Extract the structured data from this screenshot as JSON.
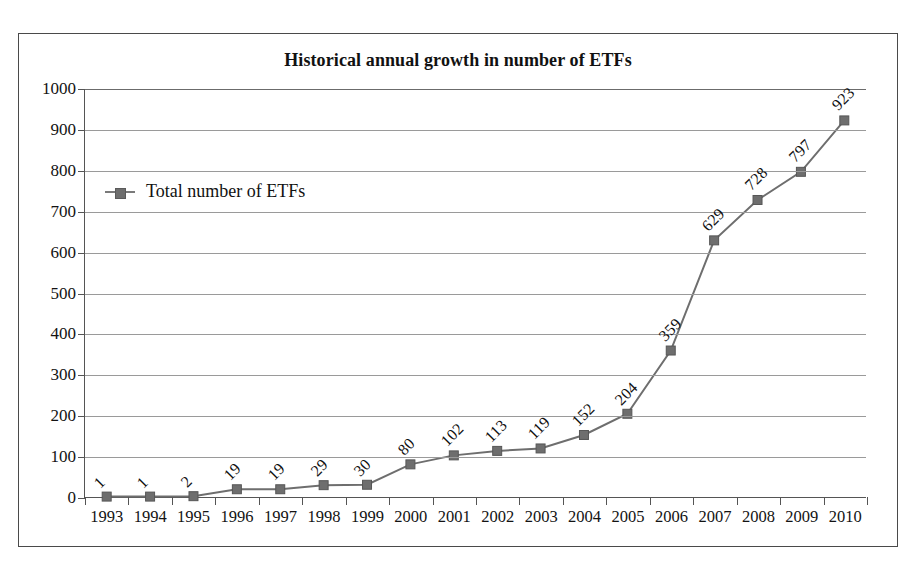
{
  "figure": {
    "title": "Historical annual growth in number of ETFs",
    "border_color": "#4a4a4a",
    "background": "#ffffff"
  },
  "legend": {
    "position": "inside-top-left",
    "marker": "square-marker-icon",
    "entries": [
      {
        "label": "Total number of ETFs",
        "color": "#6e6e6e"
      }
    ]
  },
  "axes": {
    "y": {
      "ticks": [
        "0",
        "100",
        "200",
        "300",
        "400",
        "500",
        "600",
        "700",
        "800",
        "900",
        "1000"
      ],
      "min": 0,
      "max": 1000,
      "step": 100
    },
    "x": {
      "ticks": [
        "1993",
        "1994",
        "1995",
        "1996",
        "1997",
        "1998",
        "1999",
        "2000",
        "2001",
        "2002",
        "2003",
        "2004",
        "2005",
        "2006",
        "2007",
        "2008",
        "2009",
        "2010"
      ]
    }
  },
  "chart_data": {
    "type": "line",
    "title": "Historical annual growth in number of ETFs",
    "xlabel": "",
    "ylabel": "",
    "ylim": [
      0,
      1000
    ],
    "grid": true,
    "legend_position": "inside-top-left",
    "categories": [
      "1993",
      "1994",
      "1995",
      "1996",
      "1997",
      "1998",
      "1999",
      "2000",
      "2001",
      "2002",
      "2003",
      "2004",
      "2005",
      "2006",
      "2007",
      "2008",
      "2009",
      "2010"
    ],
    "series": [
      {
        "name": "Total number of ETFs",
        "color": "#6e6e6e",
        "marker": "square",
        "data_labels": true,
        "data_label_rotation": -45,
        "values": [
          1,
          1,
          2,
          19,
          19,
          29,
          30,
          80,
          102,
          113,
          119,
          152,
          204,
          359,
          629,
          728,
          797,
          923
        ]
      }
    ]
  }
}
